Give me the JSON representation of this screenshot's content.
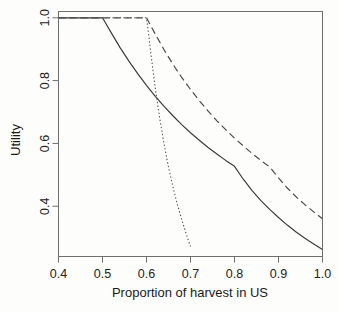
{
  "chart_data": {
    "type": "line",
    "title": "",
    "xlabel": "Proportion of harvest in US",
    "ylabel": "Utility",
    "xlim": [
      0.4,
      1.0
    ],
    "ylim": [
      0.24,
      1.02
    ],
    "grid": false,
    "legend": "none",
    "xticks": [
      "0.4",
      "0.5",
      "0.6",
      "0.7",
      "0.8",
      "0.9",
      "1.0"
    ],
    "xtick_values": [
      0.4,
      0.5,
      0.6,
      0.7,
      0.8,
      0.9,
      1.0
    ],
    "yticks": [
      "0.4",
      "0.6",
      "0.8",
      "1.0"
    ],
    "ytick_values": [
      0.4,
      0.6,
      0.8,
      1.0
    ],
    "series": [
      {
        "name": "solid-curve",
        "style": "solid",
        "color": "#3c3c3c",
        "x": [
          0.4,
          0.45,
          0.5,
          0.52,
          0.54,
          0.56,
          0.58,
          0.6,
          0.62,
          0.64,
          0.66,
          0.68,
          0.7,
          0.72,
          0.74,
          0.76,
          0.78,
          0.8,
          0.82,
          0.84,
          0.86,
          0.88,
          0.9,
          0.92,
          0.94,
          0.96,
          0.98,
          1.0
        ],
        "y": [
          1.0,
          1.0,
          1.0,
          0.952,
          0.905,
          0.862,
          0.822,
          0.785,
          0.75,
          0.718,
          0.688,
          0.66,
          0.634,
          0.61,
          0.587,
          0.566,
          0.546,
          0.527,
          0.486,
          0.45,
          0.418,
          0.39,
          0.364,
          0.34,
          0.318,
          0.298,
          0.28,
          0.262
        ]
      },
      {
        "name": "dashed-curve",
        "style": "dashed",
        "color": "#4a4a4a",
        "x": [
          0.4,
          0.45,
          0.5,
          0.55,
          0.6,
          0.62,
          0.64,
          0.66,
          0.68,
          0.7,
          0.72,
          0.74,
          0.76,
          0.78,
          0.8,
          0.82,
          0.84,
          0.86,
          0.88,
          0.9,
          0.92,
          0.94,
          0.96,
          0.98,
          1.0
        ],
        "y": [
          1.0,
          1.0,
          1.0,
          1.0,
          1.0,
          0.948,
          0.898,
          0.852,
          0.81,
          0.772,
          0.736,
          0.703,
          0.672,
          0.644,
          0.617,
          0.592,
          0.568,
          0.546,
          0.525,
          0.49,
          0.458,
          0.43,
          0.405,
          0.382,
          0.36
        ]
      },
      {
        "name": "dotted-curve",
        "style": "dotted",
        "color": "#555555",
        "x": [
          0.4,
          0.45,
          0.5,
          0.55,
          0.6,
          0.605,
          0.61,
          0.62,
          0.63,
          0.64,
          0.645,
          0.65,
          0.66,
          0.665,
          0.67,
          0.675,
          0.68,
          0.685,
          0.69,
          0.695,
          0.7
        ],
        "y": [
          1.0,
          1.0,
          1.0,
          1.0,
          1.0,
          0.945,
          0.885,
          0.775,
          0.68,
          0.598,
          0.56,
          0.525,
          0.462,
          0.434,
          0.407,
          0.382,
          0.358,
          0.335,
          0.313,
          0.292,
          0.272
        ]
      }
    ],
    "annotations": []
  },
  "axes": {
    "box_color": "#6e6e6e",
    "tick_color": "#6e6e6e"
  }
}
